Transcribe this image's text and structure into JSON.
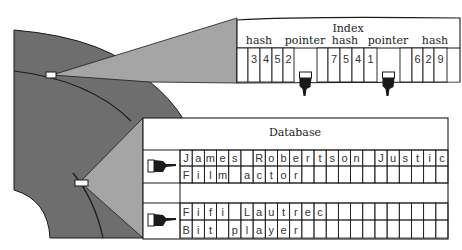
{
  "colors": {
    "disk_dark": "#6e6e6e",
    "beam_light": "#a5a5a5",
    "outline": "#1a1a1a",
    "background": "#ffffff"
  },
  "index": {
    "title": "Index",
    "labels": [
      "hash",
      "pointer",
      "hash",
      "pointer",
      "hash"
    ],
    "groups": [
      {
        "type": "hash",
        "cells": [
          "",
          "3",
          "4",
          "5",
          "2"
        ]
      },
      {
        "type": "pointer",
        "icon": "pointing-hand-down-icon"
      },
      {
        "type": "hash",
        "cells": [
          "",
          "7",
          "5",
          "4",
          "1"
        ]
      },
      {
        "type": "pointer",
        "icon": "pointing-hand-down-icon"
      },
      {
        "type": "hash",
        "cells": [
          "",
          "6",
          "2",
          "9"
        ]
      }
    ]
  },
  "database": {
    "title": "Database",
    "records": [
      {
        "pointer_icon": "pointing-hand-right-icon",
        "name": "James Robertson Justice",
        "role": "Film actor"
      },
      {
        "pointer_icon": "pointing-hand-right-icon",
        "name": "Fifi Lautrec",
        "role": "Bit player"
      }
    ],
    "columns": 22
  }
}
